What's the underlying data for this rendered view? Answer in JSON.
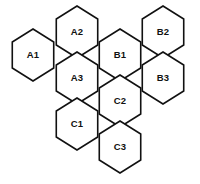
{
  "diagram": {
    "type": "honeycomb",
    "background_color": "#ffffff",
    "stroke_color": "#111111",
    "fill_color": "#ffffff",
    "stroke_width": 1.6,
    "hex_radius": 26,
    "cell_count": 9,
    "cells": [
      {
        "id": "A1",
        "label": "A1",
        "group": "A",
        "cx": 33,
        "cy": 55,
        "column": 1,
        "row": 1
      },
      {
        "id": "A2",
        "label": "A2",
        "group": "A",
        "cx": 77,
        "cy": 32,
        "column": 2,
        "row": 1
      },
      {
        "id": "A3",
        "label": "A3",
        "group": "A",
        "cx": 77,
        "cy": 78,
        "column": 2,
        "row": 2
      },
      {
        "id": "B1",
        "label": "B1",
        "group": "B",
        "cx": 120,
        "cy": 55,
        "column": 3,
        "row": 1
      },
      {
        "id": "B2",
        "label": "B2",
        "group": "B",
        "cx": 163,
        "cy": 32,
        "column": 4,
        "row": 1
      },
      {
        "id": "B3",
        "label": "B3",
        "group": "B",
        "cx": 163,
        "cy": 78,
        "column": 4,
        "row": 2
      },
      {
        "id": "C1",
        "label": "C1",
        "group": "C",
        "cx": 77,
        "cy": 124,
        "column": 2,
        "row": 3
      },
      {
        "id": "C2",
        "label": "C2",
        "group": "C",
        "cx": 120,
        "cy": 101,
        "column": 3,
        "row": 2
      },
      {
        "id": "C3",
        "label": "C3",
        "group": "C",
        "cx": 120,
        "cy": 147,
        "column": 3,
        "row": 3
      }
    ]
  }
}
